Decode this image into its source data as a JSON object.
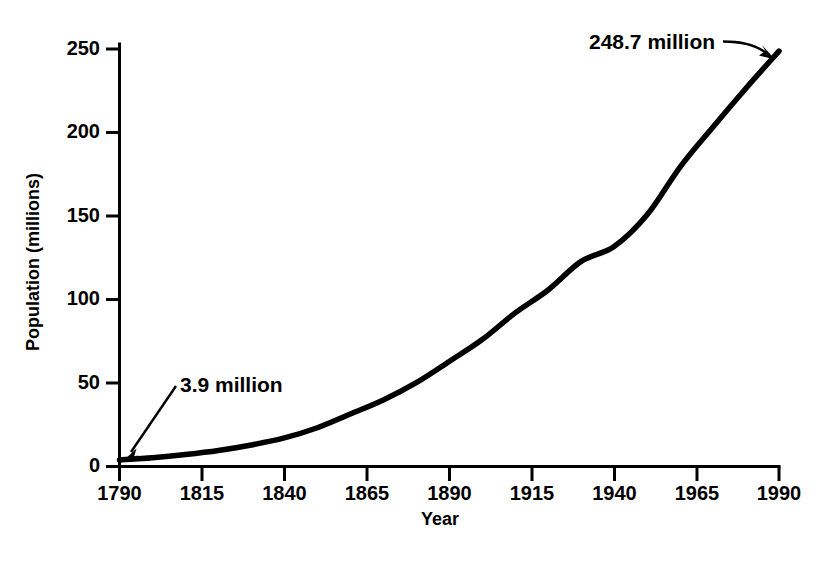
{
  "chart_data": {
    "type": "line",
    "title": "",
    "xlabel": "Year",
    "ylabel": "Population (millions)",
    "xlim": [
      1790,
      1990
    ],
    "ylim": [
      0,
      250
    ],
    "grid": false,
    "legend": "none",
    "x_ticks": [
      "1790",
      "1815",
      "1840",
      "1865",
      "1890",
      "1915",
      "1940",
      "1965",
      "1990"
    ],
    "y_ticks": [
      "0",
      "50",
      "100",
      "150",
      "200",
      "250"
    ],
    "series": [
      {
        "name": "U.S. Population",
        "x": [
          1790,
          1800,
          1810,
          1820,
          1830,
          1840,
          1850,
          1860,
          1870,
          1880,
          1890,
          1900,
          1910,
          1920,
          1930,
          1940,
          1950,
          1960,
          1970,
          1980,
          1990
        ],
        "values": [
          3.9,
          5.3,
          7.2,
          9.6,
          12.9,
          17.1,
          23.2,
          31.4,
          39.8,
          50.2,
          62.9,
          76.0,
          92.0,
          105.7,
          122.8,
          131.7,
          150.7,
          179.3,
          203.3,
          226.5,
          248.7
        ]
      }
    ],
    "annotations": [
      {
        "id": "start-annotation",
        "label": "3.9 million",
        "points_to_year": 1790,
        "points_to_value": 3.9
      },
      {
        "id": "end-annotation",
        "label": "248.7 million",
        "points_to_year": 1990,
        "points_to_value": 248.7
      }
    ]
  },
  "axes": {
    "y_title": "Population (millions)",
    "x_title": "Year"
  }
}
